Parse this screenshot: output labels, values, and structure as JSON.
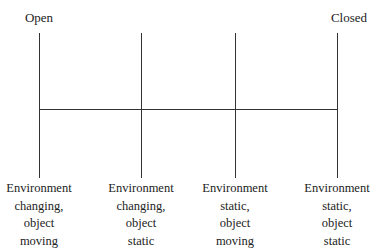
{
  "diagram": {
    "type": "continuum",
    "title": "",
    "ends": {
      "left": "Open",
      "right": "Closed"
    },
    "points": [
      {
        "lines": [
          "Environment",
          "changing,",
          "object",
          "moving"
        ]
      },
      {
        "lines": [
          "Environment",
          "changing,",
          "object",
          "static"
        ]
      },
      {
        "lines": [
          "Environment",
          "static,",
          "object",
          "moving"
        ]
      },
      {
        "lines": [
          "Environment",
          "static,",
          "object",
          "static"
        ]
      }
    ],
    "colors": {
      "line": "#333333",
      "text": "#222222",
      "background": "#ffffff"
    }
  }
}
